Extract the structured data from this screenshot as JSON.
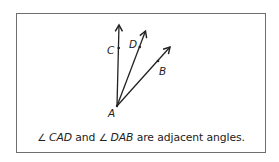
{
  "figure": {
    "vertex": {
      "label": "A",
      "x": 117,
      "y": 106
    },
    "rays": [
      {
        "name": "AC",
        "point_label": "C",
        "tip": [
          119,
          24
        ],
        "point": [
          119,
          48
        ],
        "label_pos": [
          107,
          54
        ]
      },
      {
        "name": "AD",
        "point_label": "D",
        "tip": [
          146,
          30
        ],
        "point": [
          140,
          49
        ],
        "label_pos": [
          129,
          48
        ]
      },
      {
        "name": "AB",
        "point_label": "B",
        "tip": [
          171,
          46
        ],
        "point": [
          158,
          62
        ],
        "label_pos": [
          159,
          75
        ]
      }
    ],
    "stroke_color": "#222222"
  },
  "caption": {
    "angle_symbol": "∠",
    "angle1": "CAD",
    "connector": "and",
    "angle2": "DAB",
    "tail": "are adjacent angles."
  }
}
